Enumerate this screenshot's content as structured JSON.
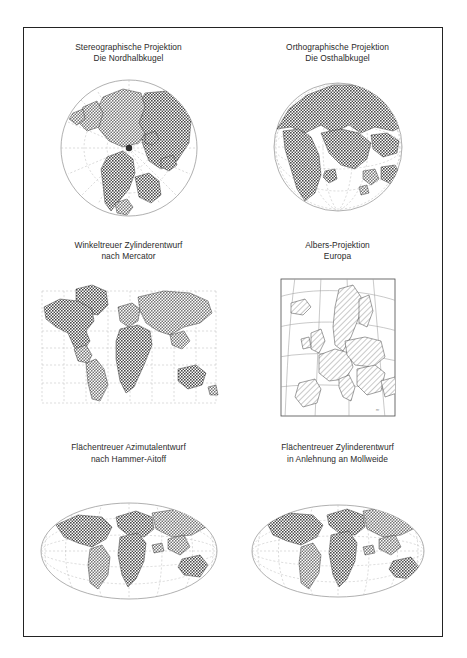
{
  "figure": {
    "background_color": "#ffffff",
    "border_color": "#232323",
    "land_fill_dark": "#6f6f6f",
    "land_fill_mid": "#8e8e8e",
    "land_fill_light": "#d8d8d8",
    "graticule_color": "#b9b9b9",
    "coastline_color": "#2e2e2e"
  },
  "panels": [
    {
      "id": "stereographic-north",
      "caption_line1": "Stereographische Projektion",
      "caption_line2": "Die Nordhalbkugel",
      "caption": "Stereographische Projektion\nDie Nordhalbkugel",
      "projection": "stereographic",
      "region": "Nordhalbkugel",
      "outline_shape": "circle",
      "graticule": "dashed-radial"
    },
    {
      "id": "orthographic-east",
      "caption_line1": "Orthographische Projektion",
      "caption_line2": "Die Osthalbkugel",
      "caption": "Orthographische Projektion\nDie Osthalbkugel",
      "projection": "orthographic",
      "region": "Osthalbkugel",
      "outline_shape": "circle",
      "graticule": "dashed-globe"
    },
    {
      "id": "mercator",
      "caption_line1": "Winkeltreuer Zylinderentwurf",
      "caption_line2": "nach Mercator",
      "caption": "Winkeltreuer Zylinderentwurf\nnach Mercator",
      "projection": "mercator",
      "region": "Welt",
      "outline_shape": "rectangle",
      "graticule": "dashed-rectilinear"
    },
    {
      "id": "albers-europa",
      "caption_line1": "Albers-Projektion",
      "caption_line2": "Europa",
      "caption": "Albers-Projektion\nEuropa",
      "projection": "albers",
      "region": "Europa",
      "outline_shape": "framed-rectangle",
      "graticule": "curved-conic",
      "corner_mark": "mr"
    },
    {
      "id": "hammer-aitoff",
      "caption_line1": "Flächentreuer Azimutalentwurf",
      "caption_line2": "nach Hammer-Aitoff",
      "caption": "Flächentreuer Azimutalentwurf\nnach Hammer-Aitoff",
      "projection": "hammer-aitoff",
      "region": "Welt",
      "outline_shape": "ellipse",
      "graticule": "dashed-curved"
    },
    {
      "id": "mollweide-like",
      "caption_line1": "Flächentreuer Zylinderentwurf",
      "caption_line2": "in Anlehnung an Mollweide",
      "caption": "Flächentreuer Zylinderentwurf\nin Anlehnung an Mollweide",
      "projection": "mollweide",
      "region": "Welt",
      "outline_shape": "ellipse",
      "graticule": "dashed-curved"
    }
  ]
}
